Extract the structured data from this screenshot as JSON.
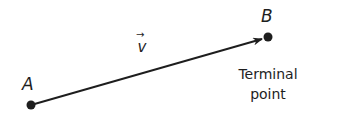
{
  "diagram": {
    "type": "vector",
    "points": [
      {
        "id": "A",
        "label": "A",
        "x": 31,
        "y": 105
      },
      {
        "id": "B",
        "label": "B",
        "x": 268,
        "y": 37
      }
    ],
    "vector": {
      "from": "A",
      "to": "B",
      "label": "v",
      "label_arrow": "→"
    },
    "caption": {
      "line1": "Terminal",
      "line2": "point"
    },
    "colors": {
      "stroke": "#1e1e1e",
      "background": "#ffffff"
    }
  }
}
